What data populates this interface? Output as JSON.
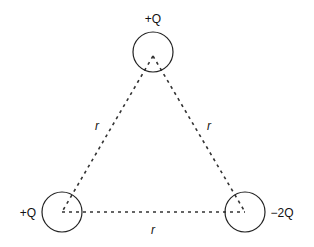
{
  "diagram": {
    "charges": [
      {
        "id": "top",
        "label": "+Q"
      },
      {
        "id": "bottom-left",
        "label": "+Q"
      },
      {
        "id": "bottom-right",
        "label": "−2Q"
      }
    ],
    "sides": [
      {
        "id": "left",
        "label": "r"
      },
      {
        "id": "right",
        "label": "r"
      },
      {
        "id": "bottom",
        "label": "r"
      }
    ],
    "colors": {
      "stroke": "#222222",
      "background": "#ffffff"
    }
  }
}
